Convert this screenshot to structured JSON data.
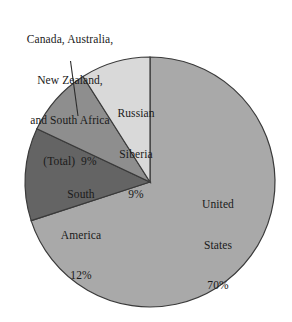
{
  "chart_data": {
    "type": "pie",
    "title": "",
    "subtitle": "",
    "xlabel": "",
    "ylabel": "",
    "legend_position": "none",
    "grid": false,
    "start_angle_deg": 90,
    "direction": "counterclockwise",
    "categories": [
      "Russian Siberia",
      "Canada, Australia, New Zealand, and South Africa (Total)",
      "South America",
      "United States"
    ],
    "values": [
      9,
      9,
      12,
      70
    ],
    "unit": "%",
    "slices": [
      {
        "name": "Russian Siberia",
        "value": 9,
        "value_label": "9%",
        "color": "#d9d9d9",
        "label_lines": [
          "Russian",
          "Siberia",
          "9%"
        ],
        "label_placement": "inside"
      },
      {
        "name": "Canada, Australia, New Zealand, and South Africa (Total)",
        "value": 9,
        "value_label": "9%",
        "color": "#8e8e8e",
        "label_lines": [
          "Canada, Australia,",
          "New Zealand,",
          "and South Africa",
          "(Total)  9%"
        ],
        "label_placement": "outside-with-leader-line"
      },
      {
        "name": "South America",
        "value": 12,
        "value_label": "12%",
        "color": "#646464",
        "label_lines": [
          "South",
          "America",
          "12%"
        ],
        "label_placement": "inside"
      },
      {
        "name": "United States",
        "value": 70,
        "value_label": "70%",
        "color": "#a9a9a9",
        "label_lines": [
          "United",
          "States",
          "70%"
        ],
        "label_placement": "inside"
      }
    ]
  },
  "labels": {
    "callout": {
      "line1": "Canada, Australia,",
      "line2": "New Zealand,",
      "line3": "and South Africa",
      "line4": "(Total)  9%"
    },
    "russian_siberia": {
      "line1": "Russian",
      "line2": "Siberia",
      "line3": "9%"
    },
    "south_america": {
      "line1": "South",
      "line2": "America",
      "line3": "12%"
    },
    "united_states": {
      "line1": "United",
      "line2": "States",
      "line3": "70%"
    }
  },
  "colors": {
    "background": "#ffffff",
    "outline": "#3a3a3a",
    "text": "#1a1a1a",
    "leader_line": "#2b2b2b"
  }
}
